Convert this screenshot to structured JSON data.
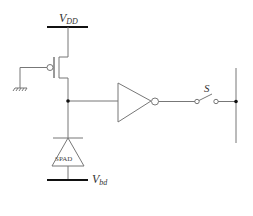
{
  "diagram": {
    "type": "circuit-schematic",
    "labels": {
      "supply_top": {
        "main": "V",
        "sub": "DD"
      },
      "supply_bottom": {
        "main": "V",
        "sub": "bd"
      },
      "switch": "S",
      "detector": "SPAD"
    },
    "components": [
      "PMOS transistor",
      "ground",
      "inverter",
      "switch",
      "SPAD diode",
      "output bus"
    ],
    "colors": {
      "wire": "#777777",
      "bar": "#111111",
      "node": "#111111"
    }
  }
}
